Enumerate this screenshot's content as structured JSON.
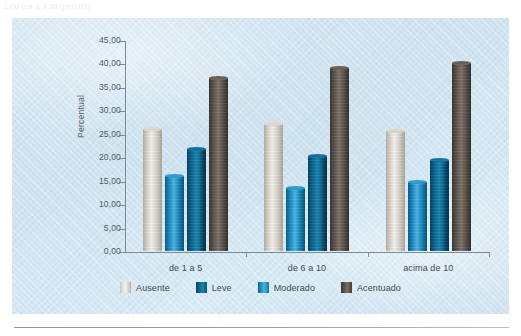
{
  "page": {
    "top_cut_text": "1,00 por 1 a 20 (p<0,05)",
    "bottom_rule": "horizontal-rule"
  },
  "chart_data": {
    "type": "bar",
    "title": "",
    "subtitle": "",
    "xlabel": "",
    "ylabel": "Percentual",
    "categories": [
      "de 1 a 5",
      "de 6 a 10",
      "acima de 10"
    ],
    "series": [
      {
        "name": "Ausente",
        "color": "#e8e4de",
        "values": [
          26.0,
          27.0,
          25.5
        ]
      },
      {
        "name": "Leve",
        "color": "#12739d",
        "values": [
          21.7,
          20.2,
          19.5
        ]
      },
      {
        "name": "Moderado",
        "color": "#2e9ed2",
        "values": [
          16.0,
          13.5,
          14.7
        ]
      },
      {
        "name": "Acentuado",
        "color": "#6b625a",
        "values": [
          37.0,
          39.0,
          40.0
        ]
      }
    ],
    "bar_draw_order": [
      "Ausente",
      "Moderado",
      "Leve",
      "Acentuado"
    ],
    "ylim": [
      0,
      45
    ],
    "ytick_step": 5,
    "ytick_labels": [
      "0,00",
      "5,00",
      "10,00",
      "15,00",
      "20,00",
      "25,00",
      "30,00",
      "35,00",
      "40,00",
      "45,00"
    ],
    "ytick_values": [
      0,
      5,
      10,
      15,
      20,
      25,
      30,
      35,
      40,
      45
    ],
    "grid": false,
    "legend_position": "bottom",
    "legend_entries": [
      "Ausente",
      "Leve",
      "Moderado",
      "Acentuado"
    ],
    "background_color": "#d3e6f1",
    "axis_color": "#7b8c99",
    "text_color": "#3f4a53"
  }
}
